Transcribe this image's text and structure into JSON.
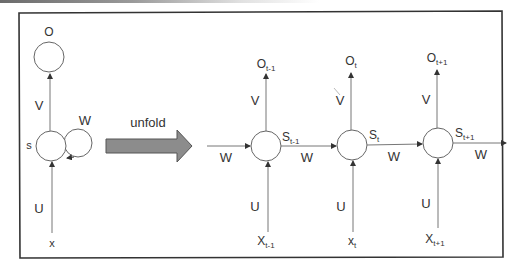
{
  "diagram": {
    "colors": {
      "stroke": "#555555",
      "border": "#333333",
      "arrow_fill": "#8c8c8c",
      "arrow_stroke": "#555555",
      "text": "#333333"
    },
    "folded": {
      "output_label": "O",
      "hidden_label": "s",
      "input_label": "x",
      "weights": {
        "input": "U",
        "output": "V",
        "recurrent": "W"
      }
    },
    "unfold_label": "unfold",
    "incoming_weight": "W",
    "steps": [
      {
        "output": "O",
        "output_sub": "t-1",
        "state": "S",
        "state_sub": "t-1",
        "input": "X",
        "input_sub": "t-1",
        "V": "V",
        "U": "U",
        "W": "W"
      },
      {
        "output": "O",
        "output_sub": "t",
        "state": "S",
        "state_sub": "t",
        "input": "x",
        "input_sub": "t",
        "V": "V",
        "U": "U",
        "W": "W"
      },
      {
        "output": "O",
        "output_sub": "t+1",
        "state": "S",
        "state_sub": "t+1",
        "input": "X",
        "input_sub": "t+1",
        "V": "V",
        "U": "U",
        "W": "W"
      }
    ]
  }
}
